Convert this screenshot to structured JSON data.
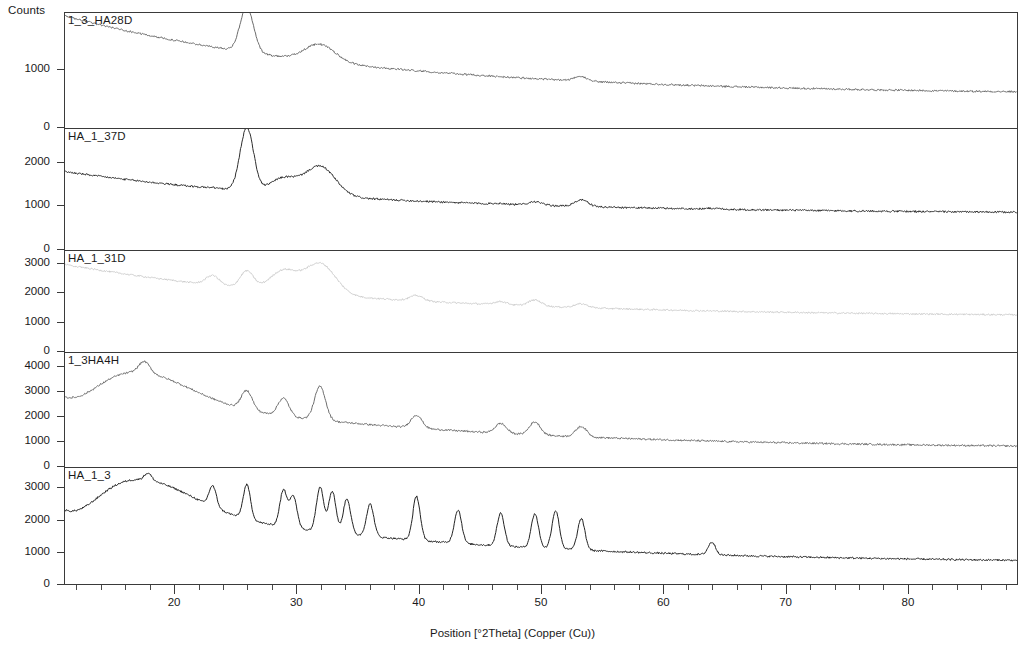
{
  "chart_data": {
    "type": "line",
    "title": "",
    "xlabel": "Position [°2Theta] (Copper (Cu))",
    "ylabel": "Counts",
    "xlim": [
      11,
      89
    ],
    "xticks_major": [
      20,
      30,
      40,
      50,
      60,
      70,
      80
    ],
    "xtick_labels": [
      "20",
      "30",
      "40",
      "50",
      "60",
      "70",
      "80"
    ],
    "xtick_minor_step": 2,
    "grid": false,
    "legend_position": "inline-top-left-of-each-panel",
    "stacked_panels": true,
    "panels": [
      {
        "name": "1_3_HA28D",
        "ylim": [
          0,
          1950
        ],
        "yticks": [
          0,
          1000
        ],
        "ytick_labels": [
          "0",
          "1000"
        ],
        "color": "#6b6b6b",
        "peaks_2theta": [
          23.1,
          25.9,
          28.9,
          31.9,
          39.8,
          46.7,
          49.5,
          53.3,
          64.1
        ],
        "peak_counts": [
          1080,
          2050,
          1200,
          1420,
          800,
          790,
          830,
          870,
          700
        ],
        "background_start_counts": 1900,
        "background_end_counts": 560
      },
      {
        "name": "HA_1_37D",
        "ylim": [
          0,
          2750
        ],
        "yticks": [
          0,
          1000,
          2000
        ],
        "ytick_labels": [
          "0",
          "1000",
          "2000"
        ],
        "color": "#2e2e2e",
        "peaks_2theta": [
          23.1,
          25.9,
          28.9,
          31.9,
          39.8,
          46.7,
          49.5,
          53.3,
          64.1
        ],
        "peak_counts": [
          1420,
          2780,
          1620,
          1900,
          1080,
          1060,
          1100,
          1140,
          950
        ],
        "background_start_counts": 1780,
        "background_end_counts": 820
      },
      {
        "name": "HA_1_31D",
        "ylim": [
          0,
          3400
        ],
        "yticks": [
          0,
          1000,
          2000,
          3000
        ],
        "ytick_labels": [
          "0",
          "1000",
          "2000",
          "3000"
        ],
        "color": "#c9c9c9",
        "peaks_2theta": [
          23.1,
          25.9,
          28.9,
          31.9,
          39.8,
          46.7,
          49.5,
          53.3
        ],
        "peak_counts": [
          2580,
          2720,
          2720,
          2980,
          1900,
          1700,
          1750,
          1620
        ],
        "background_start_counts": 2950,
        "background_end_counts": 1180
      },
      {
        "name": "1_3HA4H",
        "ylim": [
          0,
          4500
        ],
        "yticks": [
          0,
          1000,
          2000,
          3000,
          4000
        ],
        "ytick_labels": [
          "0",
          "1000",
          "2000",
          "3000",
          "4000"
        ],
        "color": "#6f6f6f",
        "peaks_2theta": [
          17.5,
          23.1,
          25.9,
          28.9,
          31.9,
          39.8,
          46.7,
          49.5,
          53.3
        ],
        "peak_counts": [
          4180,
          2680,
          3020,
          2720,
          3180,
          2050,
          1720,
          1780,
          1600
        ],
        "background_start_counts": 3380,
        "background_end_counts": 720
      },
      {
        "name": "HA_1_3",
        "ylim": [
          0,
          3600
        ],
        "yticks": [
          0,
          1000,
          2000,
          3000
        ],
        "ytick_labels": [
          "0",
          "1000",
          "2000",
          "3000"
        ],
        "color": "#242424",
        "peaks_2theta": [
          17.8,
          23.1,
          25.9,
          28.9,
          29.7,
          31.9,
          32.9,
          34.1,
          36.0,
          39.8,
          43.2,
          46.7,
          49.5,
          51.2,
          53.3,
          64.0
        ],
        "peak_counts": [
          3450,
          3050,
          3080,
          2900,
          2720,
          3020,
          2880,
          2650,
          2480,
          2720,
          2300,
          2200,
          2180,
          2280,
          2020,
          1300
        ],
        "background_start_counts": 2980,
        "background_end_counts": 640
      }
    ]
  },
  "axis": {
    "y_title": "Counts",
    "x_title": "Position [°2Theta] (Copper (Cu))"
  }
}
